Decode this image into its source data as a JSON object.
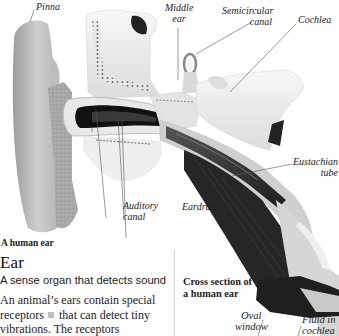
{
  "illustration": {
    "title": "A human ear",
    "labels": {
      "pinna": "Pinna",
      "middle_ear_line1": "Middle",
      "middle_ear_line2": "ear",
      "semicircular_line1": "Semicircular",
      "semicircular_line2": "canal",
      "cochlea": "Cochlea",
      "eustachian_line1": "Eustachian",
      "eustachian_line2": "tube",
      "auditory_line1": "Auditory",
      "auditory_line2": "canal",
      "eardrum": "Eardrum"
    }
  },
  "entry": {
    "title": "Ear",
    "subtitle": "A sense organ that detects sound",
    "body_part1": "An animal’s ears contain special receptors",
    "body_part2": "that can detect tiny vibrations. The receptors"
  },
  "cross_section": {
    "title": "Cross section of a human ear",
    "labels": {
      "oval_window_line1": "Oval",
      "oval_window_line2": "window",
      "fluid_line1": "Fluid in",
      "fluid_line2": "cochlea"
    }
  },
  "colors": {
    "background": "#ffffff",
    "text": "#222222",
    "tissue_gray": "#b8b8b8",
    "dark_muscle": "#2a2a2a",
    "bone_white": "#f2f2f2",
    "divider": "#d0d0d0"
  }
}
